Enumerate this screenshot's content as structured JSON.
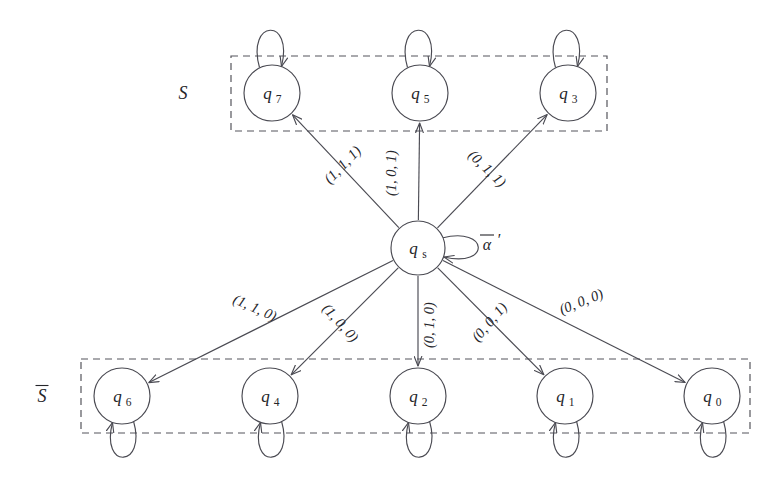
{
  "figure": {
    "type": "state-transition-diagram",
    "background_color": "#ffffff",
    "stroke_color": "#4a4a52",
    "text_color": "#25252a",
    "dash_color": "#55555c"
  },
  "groups": [
    {
      "id": "group-S",
      "label": "S",
      "label_overbar": false,
      "box": {
        "x": 231,
        "y": 56,
        "w": 376,
        "h": 75
      },
      "label_pos": {
        "x": 183,
        "y": 99
      },
      "members": [
        "q7",
        "q5",
        "q3"
      ]
    },
    {
      "id": "group-Sbar",
      "label": "S",
      "label_overbar": true,
      "box": {
        "x": 81,
        "y": 359,
        "w": 669,
        "h": 74
      },
      "label_pos": {
        "x": 42,
        "y": 402
      },
      "members": [
        "q6",
        "q4",
        "q2",
        "q1",
        "q0"
      ]
    }
  ],
  "nodes": [
    {
      "id": "qs",
      "base": "q",
      "sub": "s",
      "cx": 418,
      "cy": 248,
      "r": 27,
      "group": null
    },
    {
      "id": "q7",
      "base": "q",
      "sub": "7",
      "cx": 272,
      "cy": 93,
      "r": 28,
      "group": "group-S"
    },
    {
      "id": "q5",
      "base": "q",
      "sub": "5",
      "cx": 420,
      "cy": 93,
      "r": 28,
      "group": "group-S"
    },
    {
      "id": "q3",
      "base": "q",
      "sub": "3",
      "cx": 568,
      "cy": 93,
      "r": 28,
      "group": "group-S"
    },
    {
      "id": "q6",
      "base": "q",
      "sub": "6",
      "cx": 122,
      "cy": 396,
      "r": 28,
      "group": "group-Sbar"
    },
    {
      "id": "q4",
      "base": "q",
      "sub": "4",
      "cx": 270,
      "cy": 396,
      "r": 28,
      "group": "group-Sbar"
    },
    {
      "id": "q2",
      "base": "q",
      "sub": "2",
      "cx": 418,
      "cy": 396,
      "r": 28,
      "group": "group-Sbar"
    },
    {
      "id": "q1",
      "base": "q",
      "sub": "1",
      "cx": 565,
      "cy": 396,
      "r": 28,
      "group": "group-Sbar"
    },
    {
      "id": "q0",
      "base": "q",
      "sub": "0",
      "cx": 712,
      "cy": 396,
      "r": 28,
      "group": "group-Sbar"
    }
  ],
  "transitions": [
    {
      "id": "t-qs-q7",
      "from": "qs",
      "to": "q7",
      "label": "(1, 1, 1)",
      "label_pos": {
        "x": 346,
        "y": 168
      },
      "label_rotation": -46
    },
    {
      "id": "t-qs-q5",
      "from": "qs",
      "to": "q5",
      "label": "(1, 0, 1)",
      "label_pos": {
        "x": 396,
        "y": 173
      },
      "label_rotation": -90
    },
    {
      "id": "t-qs-q3",
      "from": "qs",
      "to": "q3",
      "label": "(0, 1, 1)",
      "label_pos": {
        "x": 484,
        "y": 172
      },
      "label_rotation": 44
    },
    {
      "id": "t-qs-q6",
      "from": "qs",
      "to": "q6",
      "label": "(1, 1, 0)",
      "label_pos": {
        "x": 253,
        "y": 312
      },
      "label_rotation": 24
    },
    {
      "id": "t-qs-q4",
      "from": "qs",
      "to": "q4",
      "label": "(1, 0, 0)",
      "label_pos": {
        "x": 337,
        "y": 326
      },
      "label_rotation": 48
    },
    {
      "id": "t-qs-q2",
      "from": "qs",
      "to": "q2",
      "label": "(0, 1, 0)",
      "label_pos": {
        "x": 434,
        "y": 325
      },
      "label_rotation": -90
    },
    {
      "id": "t-qs-q1",
      "from": "qs",
      "to": "q1",
      "label": "(0, 0, 1)",
      "label_pos": {
        "x": 493,
        "y": 325
      },
      "label_rotation": -50
    },
    {
      "id": "t-qs-q0",
      "from": "qs",
      "to": "q0",
      "label": "(0, 0, 0)",
      "label_pos": {
        "x": 583,
        "y": 306
      },
      "label_rotation": -22
    }
  ],
  "self_loops": [
    {
      "id": "loop-qs",
      "node": "qs",
      "label": "α",
      "label_overbar": true,
      "label_prime": true,
      "direction": "right",
      "label_pos": {
        "x": 487,
        "y": 250
      }
    },
    {
      "id": "loop-q7",
      "node": "q7",
      "label": "",
      "direction": "up"
    },
    {
      "id": "loop-q5",
      "node": "q5",
      "label": "",
      "direction": "up"
    },
    {
      "id": "loop-q3",
      "node": "q3",
      "label": "",
      "direction": "up"
    },
    {
      "id": "loop-q6",
      "node": "q6",
      "label": "",
      "direction": "down"
    },
    {
      "id": "loop-q4",
      "node": "q4",
      "label": "",
      "direction": "down"
    },
    {
      "id": "loop-q2",
      "node": "q2",
      "label": "",
      "direction": "down"
    },
    {
      "id": "loop-q1",
      "node": "q1",
      "label": "",
      "direction": "down"
    },
    {
      "id": "loop-q0",
      "node": "q0",
      "label": "",
      "direction": "down"
    }
  ]
}
